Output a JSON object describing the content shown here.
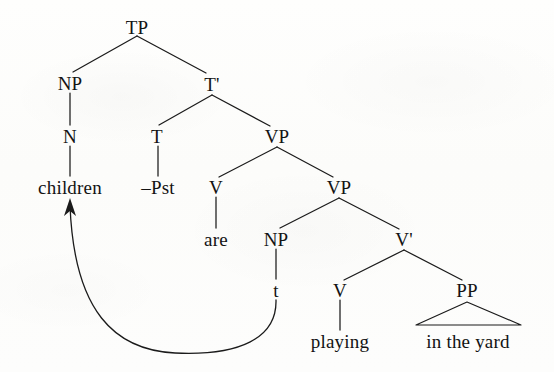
{
  "diagram": {
    "type": "syntax-tree",
    "sentence": "children -Pst are playing in the yard",
    "ink_color": "#1b1b1b",
    "background_color": "#fdfdfc"
  },
  "nodes": [
    {
      "id": "tp",
      "label": "TP",
      "x": 137,
      "y": 27,
      "kind": "phrase"
    },
    {
      "id": "np1",
      "label": "NP",
      "x": 70,
      "y": 83,
      "kind": "phrase"
    },
    {
      "id": "tbar",
      "label": "T'",
      "x": 212,
      "y": 84,
      "kind": "bar"
    },
    {
      "id": "n1",
      "label": "N",
      "x": 70,
      "y": 136,
      "kind": "head"
    },
    {
      "id": "t1",
      "label": "T",
      "x": 157,
      "y": 136,
      "kind": "head"
    },
    {
      "id": "vp1",
      "label": "VP",
      "x": 277,
      "y": 136,
      "kind": "phrase"
    },
    {
      "id": "children",
      "label": "children",
      "x": 70,
      "y": 187,
      "kind": "leaf"
    },
    {
      "id": "pst",
      "label": "–Pst",
      "x": 158,
      "y": 187,
      "kind": "leaf"
    },
    {
      "id": "v1",
      "label": "V",
      "x": 216,
      "y": 187,
      "kind": "head"
    },
    {
      "id": "vp2",
      "label": "VP",
      "x": 339,
      "y": 187,
      "kind": "phrase"
    },
    {
      "id": "are",
      "label": "are",
      "x": 216,
      "y": 239,
      "kind": "leaf"
    },
    {
      "id": "np2",
      "label": "NP",
      "x": 276,
      "y": 239,
      "kind": "phrase"
    },
    {
      "id": "vbar",
      "label": "V'",
      "x": 404,
      "y": 239,
      "kind": "bar"
    },
    {
      "id": "trace",
      "label": "t",
      "x": 276,
      "y": 290,
      "kind": "leaf"
    },
    {
      "id": "v2",
      "label": "V",
      "x": 340,
      "y": 290,
      "kind": "head"
    },
    {
      "id": "pp",
      "label": "PP",
      "x": 467,
      "y": 290,
      "kind": "phrase"
    },
    {
      "id": "playing",
      "label": "playing",
      "x": 340,
      "y": 341,
      "kind": "leaf"
    },
    {
      "id": "in_the_yard",
      "label": "in the yard",
      "x": 468,
      "y": 341,
      "kind": "leaf"
    }
  ],
  "edges": [
    {
      "from": "tp",
      "to": "np1",
      "x1": 137,
      "y1": 36,
      "x2": 73,
      "y2": 72,
      "style": "branch"
    },
    {
      "from": "tp",
      "to": "tbar",
      "x1": 137,
      "y1": 36,
      "x2": 206,
      "y2": 73,
      "style": "branch"
    },
    {
      "from": "np1",
      "to": "n1",
      "x1": 70,
      "y1": 93,
      "x2": 70,
      "y2": 125,
      "style": "stem"
    },
    {
      "from": "tbar",
      "to": "t1",
      "x1": 212,
      "y1": 95,
      "x2": 159,
      "y2": 125,
      "style": "branch"
    },
    {
      "from": "tbar",
      "to": "vp1",
      "x1": 212,
      "y1": 95,
      "x2": 270,
      "y2": 126,
      "style": "branch"
    },
    {
      "from": "n1",
      "to": "children",
      "x1": 70,
      "y1": 146,
      "x2": 70,
      "y2": 176,
      "style": "stem"
    },
    {
      "from": "t1",
      "to": "pst",
      "x1": 158,
      "y1": 146,
      "x2": 158,
      "y2": 176,
      "style": "stem"
    },
    {
      "from": "vp1",
      "to": "v1",
      "x1": 277,
      "y1": 147,
      "x2": 219,
      "y2": 177,
      "style": "branch"
    },
    {
      "from": "vp1",
      "to": "vp2",
      "x1": 277,
      "y1": 147,
      "x2": 333,
      "y2": 177,
      "style": "branch"
    },
    {
      "from": "v1",
      "to": "are",
      "x1": 216,
      "y1": 197,
      "x2": 216,
      "y2": 228,
      "style": "stem"
    },
    {
      "from": "vp2",
      "to": "np2",
      "x1": 339,
      "y1": 198,
      "x2": 280,
      "y2": 228,
      "style": "branch"
    },
    {
      "from": "vp2",
      "to": "vbar",
      "x1": 339,
      "y1": 198,
      "x2": 399,
      "y2": 229,
      "style": "branch"
    },
    {
      "from": "np2",
      "to": "trace",
      "x1": 276,
      "y1": 249,
      "x2": 276,
      "y2": 279,
      "style": "stem"
    },
    {
      "from": "vbar",
      "to": "v2",
      "x1": 404,
      "y1": 250,
      "x2": 344,
      "y2": 280,
      "style": "branch"
    },
    {
      "from": "vbar",
      "to": "pp",
      "x1": 404,
      "y1": 250,
      "x2": 462,
      "y2": 280,
      "style": "branch"
    },
    {
      "from": "v2",
      "to": "playing",
      "x1": 340,
      "y1": 300,
      "x2": 340,
      "y2": 330,
      "style": "stem"
    }
  ],
  "triangle": {
    "parent": "pp",
    "covers": "in the yard",
    "apex_x": 467,
    "apex_y": 302,
    "base_left_x": 416,
    "base_right_x": 521,
    "base_y": 325
  },
  "movement_arrow": {
    "from": "trace",
    "to": "children",
    "description": "NP movement from trace position to subject position",
    "path": "M 276 300 C 277 338, 240 356, 175 353 C 115 350, 74 312, 70 205",
    "arrow_tip_x": 70,
    "arrow_tip_y": 198,
    "arrow_points": "70,198 64,216 70,211 76,216"
  }
}
